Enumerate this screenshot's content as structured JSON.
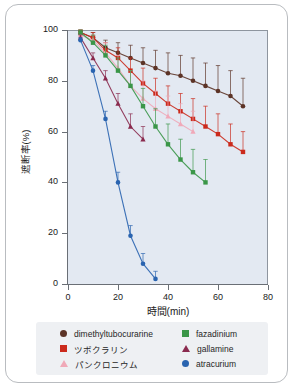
{
  "chart_data": {
    "type": "line",
    "title": "",
    "xlabel": "時間(min)",
    "ylabel": "遮断率(%)",
    "xlim": [
      0,
      80
    ],
    "ylim": [
      0,
      100
    ],
    "xticks": [
      "0",
      "20",
      "40",
      "60",
      "80"
    ],
    "yticks": [
      "0",
      "20",
      "40",
      "60",
      "80",
      "100"
    ],
    "grid": false,
    "legend_position": "below",
    "error_bars": true,
    "series": [
      {
        "name": "dimethyltubocurarine",
        "color": "#5c3326",
        "marker": "circle",
        "x": [
          5,
          10,
          15,
          20,
          25,
          30,
          35,
          40,
          45,
          50,
          55,
          60,
          65,
          70
        ],
        "y": [
          99,
          97,
          93,
          91,
          89,
          87,
          85,
          83,
          82,
          80,
          78,
          76,
          74,
          70
        ],
        "err": [
          1,
          2,
          3,
          4,
          5,
          6,
          7,
          8,
          8,
          9,
          9,
          10,
          10,
          11
        ]
      },
      {
        "name": "ツボクラリン",
        "color": "#cb2a1c",
        "marker": "square",
        "x": [
          5,
          10,
          15,
          20,
          25,
          30,
          35,
          40,
          45,
          50,
          55,
          60,
          65,
          70
        ],
        "y": [
          99,
          97,
          92,
          89,
          84,
          79,
          75,
          71,
          68,
          65,
          62,
          59,
          55,
          52
        ],
        "err": [
          1,
          2,
          3,
          4,
          5,
          6,
          6,
          7,
          7,
          8,
          8,
          8,
          8,
          8
        ]
      },
      {
        "name": "パンクロニウム",
        "color": "#f0a9b8",
        "marker": "triangle",
        "x": [
          5,
          10,
          15,
          20,
          25,
          30,
          35,
          40,
          45,
          50
        ],
        "y": [
          98,
          96,
          91,
          85,
          78,
          73,
          69,
          66,
          63,
          60
        ],
        "err": [
          1,
          2,
          4,
          5,
          6,
          7,
          7,
          8,
          8,
          8
        ]
      },
      {
        "name": "fazadinium",
        "color": "#3a9648",
        "marker": "square",
        "x": [
          5,
          10,
          15,
          20,
          25,
          30,
          35,
          40,
          45,
          50,
          55
        ],
        "y": [
          99,
          95,
          90,
          84,
          78,
          70,
          62,
          55,
          49,
          44,
          40
        ],
        "err": [
          1,
          3,
          4,
          5,
          6,
          7,
          7,
          8,
          8,
          9,
          9
        ]
      },
      {
        "name": "gallamine",
        "color": "#8a2a4e",
        "marker": "triangle",
        "x": [
          5,
          10,
          15,
          20,
          25,
          30
        ],
        "y": [
          97,
          89,
          81,
          71,
          62,
          57
        ],
        "err": [
          1,
          2,
          3,
          4,
          5,
          5
        ]
      },
      {
        "name": "atracurium",
        "color": "#2a64b0",
        "marker": "circle",
        "x": [
          5,
          10,
          15,
          20,
          25,
          30,
          35
        ],
        "y": [
          96,
          84,
          65,
          40,
          19,
          8,
          2
        ],
        "err": [
          1,
          2,
          3,
          4,
          4,
          4,
          3
        ]
      }
    ]
  },
  "legend": {
    "left_column": [
      {
        "label": "dimethyltubocurarine",
        "color": "#5c3326",
        "marker": "circle"
      },
      {
        "label": "ツボクラリン",
        "color": "#cb2a1c",
        "marker": "square"
      },
      {
        "label": "パンクロニウム",
        "color": "#f0a9b8",
        "marker": "triangle"
      }
    ],
    "right_column": [
      {
        "label": "fazadinium",
        "color": "#3a9648",
        "marker": "square"
      },
      {
        "label": "gallamine",
        "color": "#8a2a4e",
        "marker": "triangle"
      },
      {
        "label": "atracurium",
        "color": "#2a64b0",
        "marker": "circle"
      }
    ]
  }
}
